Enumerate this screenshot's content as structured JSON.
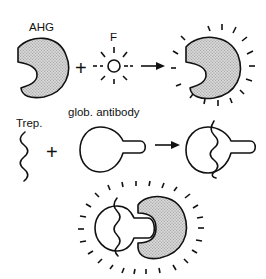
{
  "diagram": {
    "row1": {
      "reactant1_label": "AHG",
      "plus": "+",
      "reactant2_label": "F",
      "product": "fluorescent AHG (AHG + F)"
    },
    "row2": {
      "reactant1_label": "Trep.",
      "plus": "+",
      "reactant2_label": "glob. antibody",
      "product": "Trep. bound to glob. antibody"
    },
    "row3": {
      "product": "fluorescent complex: Trep. + glob. antibody + fluorescent AHG"
    },
    "colors": {
      "line": "#111111",
      "shade": "#c8c8c8",
      "background": "#ffffff"
    }
  }
}
